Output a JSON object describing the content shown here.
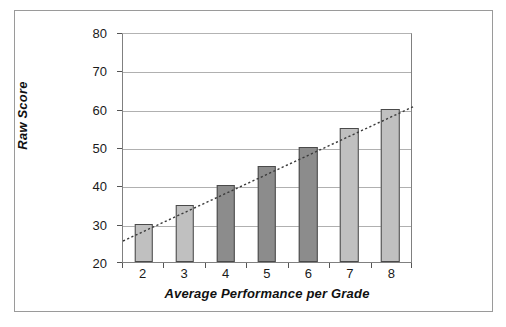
{
  "figure": {
    "frame_border_color": "#9a9a9a",
    "background": "#ffffff"
  },
  "axes": {
    "y_title": "Raw Score",
    "x_title": "Average Performance per Grade",
    "y_ticks": [
      "80",
      "70",
      "60",
      "50",
      "40",
      "30",
      "20"
    ],
    "x_ticks": [
      "2",
      "3",
      "4",
      "5",
      "6",
      "7",
      "8"
    ]
  },
  "colors": {
    "bar_light": "#c0c0c0",
    "bar_dark": "#8c8c8c",
    "bar_outline": "#4a4a4a",
    "gridline": "#b0b0b0",
    "axis": "#808080",
    "trendline": "#3a3a3a",
    "text": "#1a1a1a"
  },
  "chart_data": {
    "type": "bar",
    "title": "",
    "subtitle": "",
    "xlabel": "Average Performance per Grade",
    "ylabel": "Raw Score",
    "categories": [
      "2",
      "3",
      "4",
      "5",
      "6",
      "7",
      "8"
    ],
    "values": [
      30,
      35,
      40,
      45,
      50,
      55,
      60
    ],
    "bar_colors": [
      "#c0c0c0",
      "#c0c0c0",
      "#8c8c8c",
      "#8c8c8c",
      "#8c8c8c",
      "#c0c0c0",
      "#c0c0c0"
    ],
    "ylim": [
      20,
      80
    ],
    "y_tick_values": [
      20,
      30,
      40,
      50,
      60,
      70,
      80
    ],
    "grid": true,
    "grid_axis": "y",
    "legend": false,
    "legend_position": "none",
    "annotations": [],
    "series": [
      {
        "name": "Raw Score",
        "values": [
          30,
          35,
          40,
          45,
          50,
          55,
          60
        ]
      },
      {
        "name": "Linear trendline",
        "type": "line",
        "style": "dotted",
        "endpoints": [
          {
            "x": 1.5,
            "y": 26
          },
          {
            "x": 8.5,
            "y": 61
          }
        ]
      }
    ]
  }
}
